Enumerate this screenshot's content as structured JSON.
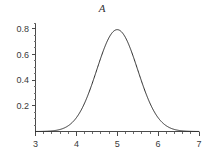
{
  "chart_data": {
    "type": "line",
    "title": "A",
    "xlabel": "",
    "ylabel": "",
    "xlim": [
      3,
      7
    ],
    "ylim": [
      0,
      0.85
    ],
    "grid": false,
    "legend": null,
    "x_ticks": [
      3,
      4,
      5,
      6,
      7
    ],
    "x_tick_labels": [
      "3",
      "4",
      "5",
      "6",
      "7"
    ],
    "x_minor_tick_interval": 0.2,
    "y_ticks": [
      0.2,
      0.4,
      0.6,
      0.8
    ],
    "y_tick_labels": [
      "0.2",
      "0.4",
      "0.6",
      "0.8"
    ],
    "y_minor_tick_interval": 0.05,
    "curve_color": "#2b2b2b",
    "distribution": {
      "mean": 5,
      "sigma": 0.5,
      "peak_value": 0.8
    },
    "series": [
      {
        "name": "A",
        "x": [
          3.0,
          3.1,
          3.2,
          3.3,
          3.4,
          3.5,
          3.6,
          3.7,
          3.8,
          3.9,
          4.0,
          4.1,
          4.2,
          4.3,
          4.4,
          4.5,
          4.6,
          4.7,
          4.8,
          4.9,
          5.0,
          5.1,
          5.2,
          5.3,
          5.4,
          5.5,
          5.6,
          5.7,
          5.8,
          5.9,
          6.0,
          6.1,
          6.2,
          6.3,
          6.4,
          6.5,
          6.6,
          6.7,
          6.8,
          6.9,
          7.0
        ],
        "values": [
          0.0002,
          0.0005,
          0.0012,
          0.0027,
          0.0058,
          0.0116,
          0.0222,
          0.0404,
          0.0702,
          0.1164,
          0.184,
          0.278,
          0.401,
          0.5521,
          0.726,
          0.912,
          1.094,
          1.253,
          1.37,
          1.433,
          1.458,
          1.433,
          1.37,
          1.253,
          1.094,
          0.912,
          0.726,
          0.5521,
          0.401,
          0.278,
          0.184,
          0.1164,
          0.0702,
          0.0404,
          0.0222,
          0.0116,
          0.0058,
          0.0027,
          0.0012,
          0.0005,
          0.0002
        ]
      }
    ],
    "note_values_scaled": "series values are unnormalized shape weights; rendered curve uses normal pdf with mean 5, sigma 0.5 peaking at 0.798"
  },
  "title_text": "A"
}
